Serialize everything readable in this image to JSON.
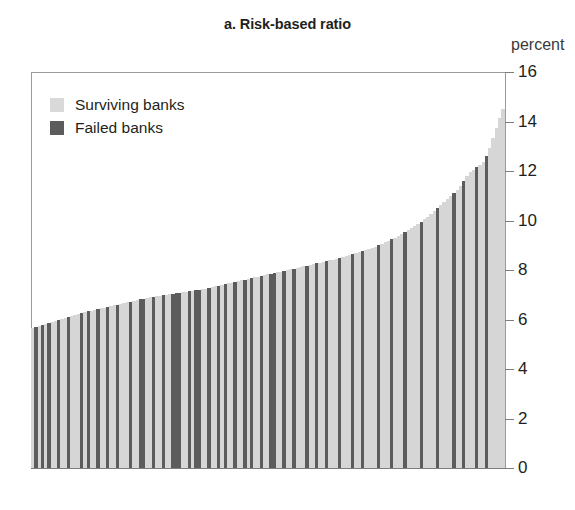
{
  "title": "a. Risk-based ratio",
  "axis_unit_label": "percent",
  "legend": {
    "items": [
      {
        "label": "Surviving banks",
        "key": "s",
        "color": "#d6d6d6"
      },
      {
        "label": "Failed banks",
        "key": "f",
        "color": "#5c5c5c"
      }
    ]
  },
  "colors": {
    "surviving": "#d6d6d6",
    "failed": "#5c5c5c",
    "axis": "#9a9a9a",
    "text": "#231f20"
  },
  "chart_data": {
    "type": "bar",
    "title": "a. Risk-based ratio",
    "subtitle": "",
    "xlabel": "",
    "ylabel": "percent",
    "ylim": [
      0,
      16
    ],
    "yticks": [
      0,
      2,
      4,
      6,
      8,
      10,
      12,
      14,
      16
    ],
    "ytick_labels": [
      "0",
      "2",
      "4",
      "6",
      "8",
      "10",
      "12",
      "14",
      "16"
    ],
    "grid": false,
    "legend_position": "top-left",
    "xaxis_ticks": false,
    "series": [
      {
        "name": "Surviving banks",
        "color": "#d6d6d6"
      },
      {
        "name": "Failed banks",
        "color": "#5c5c5c"
      }
    ],
    "categories": [
      "1",
      "2",
      "3",
      "4",
      "5",
      "6",
      "7",
      "8",
      "9",
      "10",
      "11",
      "12",
      "13",
      "14",
      "15",
      "16",
      "17",
      "18",
      "19",
      "20",
      "21",
      "22",
      "23",
      "24",
      "25",
      "26",
      "27",
      "28",
      "29",
      "30",
      "31",
      "32",
      "33",
      "34",
      "35",
      "36",
      "37",
      "38",
      "39",
      "40",
      "41",
      "42",
      "43",
      "44",
      "45",
      "46",
      "47",
      "48",
      "49",
      "50",
      "51",
      "52",
      "53",
      "54",
      "55",
      "56",
      "57",
      "58",
      "59",
      "60",
      "61",
      "62",
      "63",
      "64",
      "65",
      "66",
      "67",
      "68",
      "69",
      "70",
      "71",
      "72",
      "73",
      "74",
      "75",
      "76",
      "77",
      "78",
      "79",
      "80",
      "81",
      "82",
      "83",
      "84",
      "85",
      "86",
      "87",
      "88",
      "89",
      "90",
      "91",
      "92",
      "93",
      "94",
      "95",
      "96",
      "97",
      "98",
      "99",
      "100",
      "101",
      "102",
      "103",
      "104",
      "105",
      "106",
      "107",
      "108",
      "109",
      "110",
      "111",
      "112",
      "113",
      "114",
      "115",
      "116",
      "117",
      "118",
      "119",
      "120",
      "121",
      "122",
      "123",
      "124",
      "125",
      "126",
      "127",
      "128",
      "129",
      "130",
      "131",
      "132",
      "133",
      "134",
      "135",
      "136",
      "137",
      "138",
      "139",
      "140",
      "141",
      "142",
      "143",
      "144",
      "145"
    ],
    "values": [
      5.65,
      5.7,
      5.74,
      5.78,
      5.82,
      5.86,
      5.9,
      5.94,
      5.98,
      6.02,
      6.06,
      6.1,
      6.14,
      6.18,
      6.22,
      6.26,
      6.3,
      6.33,
      6.36,
      6.39,
      6.42,
      6.45,
      6.48,
      6.51,
      6.54,
      6.57,
      6.6,
      6.63,
      6.66,
      6.69,
      6.72,
      6.75,
      6.78,
      6.81,
      6.84,
      6.87,
      6.9,
      6.92,
      6.94,
      6.96,
      6.98,
      7.0,
      7.02,
      7.04,
      7.06,
      7.08,
      7.1,
      7.12,
      7.14,
      7.16,
      7.18,
      7.2,
      7.22,
      7.25,
      7.28,
      7.31,
      7.34,
      7.37,
      7.4,
      7.43,
      7.46,
      7.49,
      7.52,
      7.55,
      7.58,
      7.61,
      7.64,
      7.67,
      7.7,
      7.73,
      7.76,
      7.79,
      7.82,
      7.85,
      7.88,
      7.91,
      7.94,
      7.97,
      8.0,
      8.03,
      8.06,
      8.09,
      8.12,
      8.15,
      8.18,
      8.21,
      8.24,
      8.27,
      8.3,
      8.33,
      8.36,
      8.39,
      8.42,
      8.45,
      8.48,
      8.52,
      8.56,
      8.6,
      8.64,
      8.68,
      8.72,
      8.76,
      8.8,
      8.85,
      8.9,
      8.95,
      9.0,
      9.06,
      9.12,
      9.18,
      9.24,
      9.3,
      9.38,
      9.46,
      9.54,
      9.62,
      9.7,
      9.78,
      9.86,
      9.94,
      10.05,
      10.16,
      10.28,
      10.4,
      10.52,
      10.64,
      10.76,
      10.88,
      11.0,
      11.12,
      11.25,
      11.4,
      11.58,
      11.8,
      11.95,
      12.05,
      12.15,
      12.25,
      12.35,
      12.6,
      12.95,
      13.35,
      13.75,
      14.15,
      14.5
    ],
    "bar_types": [
      "s",
      "f",
      "s",
      "f",
      "s",
      "f",
      "s",
      "s",
      "f",
      "s",
      "s",
      "f",
      "s",
      "s",
      "s",
      "f",
      "s",
      "f",
      "s",
      "s",
      "f",
      "s",
      "s",
      "f",
      "s",
      "s",
      "f",
      "s",
      "s",
      "s",
      "f",
      "s",
      "s",
      "f",
      "f",
      "s",
      "s",
      "f",
      "s",
      "s",
      "f",
      "s",
      "s",
      "f",
      "f",
      "f",
      "s",
      "s",
      "f",
      "s",
      "f",
      "f",
      "s",
      "s",
      "f",
      "s",
      "s",
      "f",
      "s",
      "f",
      "s",
      "s",
      "f",
      "s",
      "s",
      "f",
      "s",
      "f",
      "s",
      "s",
      "f",
      "s",
      "s",
      "f",
      "f",
      "s",
      "s",
      "f",
      "s",
      "s",
      "f",
      "s",
      "s",
      "s",
      "f",
      "s",
      "s",
      "f",
      "s",
      "s",
      "f",
      "s",
      "s",
      "s",
      "f",
      "s",
      "s",
      "s",
      "f",
      "s",
      "s",
      "f",
      "s",
      "s",
      "s",
      "s",
      "f",
      "s",
      "s",
      "s",
      "f",
      "s",
      "s",
      "s",
      "f",
      "s",
      "s",
      "s",
      "s",
      "f",
      "s",
      "s",
      "s",
      "s",
      "f",
      "s",
      "s",
      "s",
      "s",
      "f",
      "s",
      "s",
      "f",
      "s",
      "s",
      "s",
      "f",
      "s",
      "s",
      "f",
      "s",
      "s",
      "s",
      "s",
      "s"
    ]
  }
}
